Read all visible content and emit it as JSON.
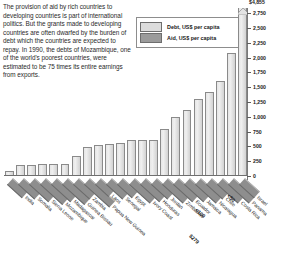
{
  "intro": {
    "text": "The provision of aid by rich countries to developing countries is part of international politics. But the grants made to developing countries are often dwarfed by the burden of debt which the countries are expected to repay. In 1990, the debts of Mozambique, one of the world's poorest countries, were estimated to be 75 times its entire earnings from exports."
  },
  "legend": {
    "items": [
      {
        "label": "Debt, US$ per capita",
        "color": "#dcdcdc",
        "key": "debt"
      },
      {
        "label": "Aid, US$ per capita",
        "color": "#9b9b9b",
        "key": "aid"
      }
    ]
  },
  "annotations": [
    {
      "text": "<50",
      "x": 228,
      "y": 192,
      "rotate": 42
    },
    {
      "text": "<100",
      "x": 196,
      "y": 206,
      "rotate": 42
    },
    {
      "text": "$279",
      "x": 190,
      "y": 232,
      "rotate": 42
    }
  ],
  "chart_data": {
    "type": "bar",
    "title": "",
    "xlabel": "",
    "ylabel": "US$ per capita",
    "ylim": [
      0,
      2750
    ],
    "grid": false,
    "legend_position": "top-right",
    "ytick_labels": [
      "0",
      "250",
      "500",
      "750",
      "1,000",
      "1,250",
      "1,500",
      "1,750",
      "2,000",
      "2,250",
      "2,500",
      "2,750"
    ],
    "ytick_values": [
      0,
      250,
      500,
      750,
      1000,
      1250,
      1500,
      1750,
      2000,
      2250,
      2500,
      2750
    ],
    "top_label": "$4,855",
    "categories": [
      "India",
      "Somalia",
      "Sierra Leone",
      "Mozambique",
      "Madagascar",
      "Guinea Bissau",
      "Zambia",
      "Papua New Guinea",
      "Laos",
      "Senegal",
      "Egypt",
      "Ivory Coast",
      "Honduras",
      "Jordan",
      "Zimbabwe",
      "Ecuador",
      "Jamaica",
      "Nicaragua",
      "Chile",
      "Costa Rica",
      "Panama",
      "Israel"
    ],
    "series": [
      {
        "name": "Debt, US$ per capita",
        "values": [
          85,
          180,
          190,
          200,
          195,
          210,
          330,
          490,
          520,
          545,
          560,
          600,
          600,
          610,
          790,
          990,
          1120,
          1300,
          1420,
          1600,
          2070,
          4855
        ]
      }
    ],
    "broken_bar_index": 21,
    "notes": [
      "<50",
      "<100",
      "$279"
    ]
  }
}
